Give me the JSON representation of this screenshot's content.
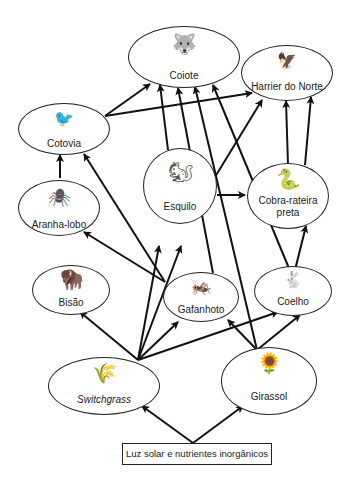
{
  "diagram": {
    "type": "food-web",
    "nodes": [
      {
        "id": "coiote",
        "label": "Coiote",
        "icon": "coyote-icon"
      },
      {
        "id": "harrier",
        "label": "Harrier do Norte",
        "icon": "hawk-icon"
      },
      {
        "id": "cotovia",
        "label": "Cotovia",
        "icon": "lark-icon"
      },
      {
        "id": "esquilo",
        "label": "Esquilo",
        "icon": "squirrel-icon"
      },
      {
        "id": "cobra",
        "label": "Cobra-rateira preta",
        "label_line1": "Cobra-rateira",
        "label_line2": "preta",
        "icon": "snake-icon"
      },
      {
        "id": "aranha",
        "label": "Aranha-lobo",
        "icon": "spider-icon"
      },
      {
        "id": "bisao",
        "label": "Bisão",
        "icon": "bison-icon"
      },
      {
        "id": "gafanhoto",
        "label": "Gafanhoto",
        "icon": "grasshopper-icon"
      },
      {
        "id": "coelho",
        "label": "Coelho",
        "icon": "rabbit-icon"
      },
      {
        "id": "switchgrass",
        "label": "Switchgrass",
        "icon": "grass-icon"
      },
      {
        "id": "girassol",
        "label": "Girassol",
        "icon": "sunflower-icon"
      }
    ],
    "source": {
      "label": "Luz solar e nutrientes inorgânicos"
    },
    "edges": [
      {
        "from": "source",
        "to": "switchgrass"
      },
      {
        "from": "source",
        "to": "girassol"
      },
      {
        "from": "switchgrass",
        "to": "bisao"
      },
      {
        "from": "switchgrass",
        "to": "esquilo"
      },
      {
        "from": "switchgrass",
        "to": "coiote"
      },
      {
        "from": "switchgrass",
        "to": "gafanhoto"
      },
      {
        "from": "switchgrass",
        "to": "coelho"
      },
      {
        "from": "girassol",
        "to": "gafanhoto"
      },
      {
        "from": "girassol",
        "to": "coelho"
      },
      {
        "from": "girassol",
        "to": "esquilo"
      },
      {
        "from": "girassol",
        "to": "coiote"
      },
      {
        "from": "gafanhoto",
        "to": "cotovia"
      },
      {
        "from": "gafanhoto",
        "to": "aranha"
      },
      {
        "from": "gafanhoto",
        "to": "coiote"
      },
      {
        "from": "aranha",
        "to": "cotovia"
      },
      {
        "from": "cotovia",
        "to": "coiote"
      },
      {
        "from": "cotovia",
        "to": "harrier"
      },
      {
        "from": "esquilo",
        "to": "coiote"
      },
      {
        "from": "esquilo",
        "to": "harrier"
      },
      {
        "from": "esquilo",
        "to": "cobra"
      },
      {
        "from": "coelho",
        "to": "cobra"
      },
      {
        "from": "coelho",
        "to": "coiote"
      },
      {
        "from": "coelho",
        "to": "harrier"
      },
      {
        "from": "cobra",
        "to": "harrier"
      }
    ]
  }
}
